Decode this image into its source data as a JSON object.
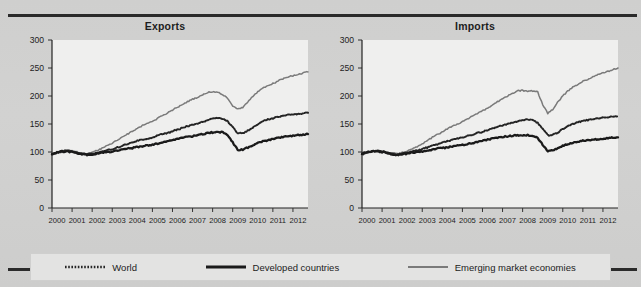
{
  "figure": {
    "background_color": "#d0d0cf",
    "rule_color": "#2a2a2a"
  },
  "legend": {
    "items": [
      {
        "label": "World",
        "style": "dotted",
        "color": "#242424",
        "swatch_name": "legend-swatch-world"
      },
      {
        "label": "Developed countries",
        "style": "solid-thick",
        "color": "#1a1a1a",
        "swatch_name": "legend-swatch-developed"
      },
      {
        "label": "Emerging market economies",
        "style": "solid",
        "color": "#7a7a7a",
        "swatch_name": "legend-swatch-emerging"
      }
    ]
  },
  "chart_data": [
    {
      "type": "line",
      "title": "Exports",
      "xlabel": "",
      "ylabel": "",
      "ylim": [
        0,
        300
      ],
      "yticks": [
        0,
        50,
        100,
        150,
        200,
        250,
        300
      ],
      "xlim": [
        2000,
        2012.75
      ],
      "xticks": [
        2000,
        2001,
        2002,
        2003,
        2004,
        2005,
        2006,
        2007,
        2008,
        2009,
        2010,
        2011,
        2012
      ],
      "xtick_labels": [
        "2000",
        "2001",
        "2002",
        "2003",
        "2004",
        "2005",
        "2006",
        "2007",
        "2008",
        "2009",
        "2010",
        "2011",
        "2012"
      ],
      "grid": false,
      "legend_position": "below-figure",
      "x": [
        2000.0,
        2000.25,
        2000.5,
        2000.75,
        2001.0,
        2001.25,
        2001.5,
        2001.75,
        2002.0,
        2002.25,
        2002.5,
        2002.75,
        2003.0,
        2003.25,
        2003.5,
        2003.75,
        2004.0,
        2004.25,
        2004.5,
        2004.75,
        2005.0,
        2005.25,
        2005.5,
        2005.75,
        2006.0,
        2006.25,
        2006.5,
        2006.75,
        2007.0,
        2007.25,
        2007.5,
        2007.75,
        2008.0,
        2008.25,
        2008.5,
        2008.75,
        2009.0,
        2009.25,
        2009.5,
        2009.75,
        2010.0,
        2010.25,
        2010.5,
        2010.75,
        2011.0,
        2011.25,
        2011.5,
        2011.75,
        2012.0,
        2012.25,
        2012.5,
        2012.75
      ],
      "series": [
        {
          "name": "World",
          "color": "#242424",
          "style": "dotted",
          "values": [
            96,
            99,
            101,
            102,
            101,
            99,
            97,
            96,
            97,
            99,
            101,
            103,
            105,
            108,
            111,
            114,
            117,
            120,
            122,
            124,
            126,
            129,
            132,
            134,
            137,
            140,
            143,
            146,
            148,
            151,
            154,
            157,
            159,
            161,
            160,
            155,
            144,
            134,
            133,
            138,
            144,
            150,
            155,
            158,
            160,
            163,
            165,
            166,
            167,
            168,
            169,
            170
          ]
        },
        {
          "name": "Developed countries",
          "color": "#1a1a1a",
          "style": "solid-thick",
          "values": [
            96,
            99,
            101,
            101,
            100,
            98,
            96,
            95,
            96,
            97,
            99,
            100,
            101,
            103,
            104,
            106,
            107,
            109,
            110,
            112,
            113,
            115,
            117,
            119,
            121,
            123,
            125,
            127,
            128,
            130,
            132,
            134,
            135,
            136,
            135,
            130,
            117,
            104,
            104,
            108,
            112,
            116,
            119,
            121,
            123,
            125,
            127,
            128,
            129,
            130,
            131,
            132
          ]
        },
        {
          "name": "Emerging market economies",
          "color": "#7a7a7a",
          "style": "solid",
          "values": [
            95,
            99,
            102,
            103,
            102,
            100,
            98,
            97,
            99,
            103,
            107,
            111,
            116,
            121,
            127,
            132,
            137,
            142,
            147,
            151,
            155,
            160,
            165,
            170,
            175,
            180,
            185,
            190,
            194,
            198,
            202,
            206,
            208,
            207,
            203,
            196,
            181,
            177,
            180,
            190,
            199,
            208,
            214,
            218,
            222,
            227,
            231,
            234,
            236,
            238,
            241,
            243
          ]
        }
      ]
    },
    {
      "type": "line",
      "title": "Imports",
      "xlabel": "",
      "ylabel": "",
      "ylim": [
        0,
        300
      ],
      "yticks": [
        0,
        50,
        100,
        150,
        200,
        250,
        300
      ],
      "xlim": [
        2000,
        2012.75
      ],
      "xticks": [
        2000,
        2001,
        2002,
        2003,
        2004,
        2005,
        2006,
        2007,
        2008,
        2009,
        2010,
        2011,
        2012
      ],
      "xtick_labels": [
        "2000",
        "2001",
        "2002",
        "2003",
        "2004",
        "2005",
        "2006",
        "2007",
        "2008",
        "2009",
        "2010",
        "2011",
        "2012"
      ],
      "grid": false,
      "legend_position": "below-figure",
      "x": [
        2000.0,
        2000.25,
        2000.5,
        2000.75,
        2001.0,
        2001.25,
        2001.5,
        2001.75,
        2002.0,
        2002.25,
        2002.5,
        2002.75,
        2003.0,
        2003.25,
        2003.5,
        2003.75,
        2004.0,
        2004.25,
        2004.5,
        2004.75,
        2005.0,
        2005.25,
        2005.5,
        2005.75,
        2006.0,
        2006.25,
        2006.5,
        2006.75,
        2007.0,
        2007.25,
        2007.5,
        2007.75,
        2008.0,
        2008.25,
        2008.5,
        2008.75,
        2009.0,
        2009.25,
        2009.5,
        2009.75,
        2010.0,
        2010.25,
        2010.5,
        2010.75,
        2011.0,
        2011.25,
        2011.5,
        2011.75,
        2012.0,
        2012.25,
        2012.5,
        2012.75
      ],
      "series": [
        {
          "name": "World",
          "color": "#242424",
          "style": "dotted",
          "values": [
            96,
            99,
            101,
            102,
            101,
            99,
            97,
            96,
            97,
            99,
            101,
            103,
            105,
            108,
            111,
            114,
            117,
            119,
            122,
            124,
            126,
            129,
            131,
            134,
            136,
            139,
            142,
            145,
            147,
            150,
            152,
            155,
            157,
            158,
            157,
            152,
            141,
            130,
            130,
            135,
            141,
            146,
            150,
            153,
            155,
            157,
            159,
            160,
            161,
            162,
            163,
            163
          ]
        },
        {
          "name": "Developed countries",
          "color": "#1a1a1a",
          "style": "solid-thick",
          "values": [
            97,
            100,
            101,
            101,
            100,
            98,
            96,
            95,
            96,
            97,
            99,
            100,
            101,
            103,
            104,
            106,
            107,
            108,
            110,
            111,
            113,
            114,
            116,
            118,
            120,
            122,
            124,
            126,
            127,
            128,
            129,
            130,
            130,
            130,
            129,
            125,
            113,
            102,
            103,
            107,
            111,
            114,
            117,
            119,
            120,
            121,
            122,
            123,
            124,
            125,
            126,
            126
          ]
        },
        {
          "name": "Emerging market economies",
          "color": "#7a7a7a",
          "style": "solid",
          "values": [
            95,
            98,
            101,
            102,
            101,
            99,
            98,
            97,
            99,
            102,
            106,
            110,
            115,
            120,
            126,
            131,
            136,
            141,
            146,
            150,
            154,
            159,
            164,
            169,
            173,
            178,
            184,
            190,
            195,
            200,
            205,
            209,
            210,
            208,
            209,
            207,
            185,
            169,
            176,
            189,
            200,
            209,
            216,
            221,
            226,
            230,
            234,
            238,
            241,
            244,
            247,
            250
          ]
        }
      ]
    }
  ]
}
